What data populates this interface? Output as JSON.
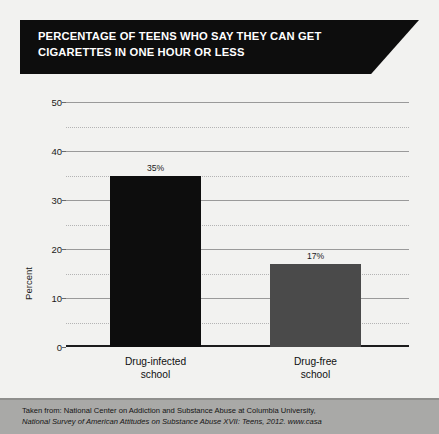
{
  "banner": {
    "line1": "PERCENTAGE OF TEENS WHO SAY THEY CAN GET",
    "line2": "CIGARETTES IN ONE HOUR OR LESS"
  },
  "footer": {
    "line1": "Taken from: National Center on Addiction and Substance Abuse at Columbia University,",
    "line2": "National Survey of American Attitudes on Substance Abuse XVII: Teens, 2012. www.casa"
  },
  "colors": {
    "bar_drug_infected": "#0d0d0d",
    "bar_drug_free": "#4a4a4a",
    "banner_background": "#0d0d0d",
    "page_background": "#f2f2f0",
    "footer_background": "#a9a9a7"
  },
  "chart_data": {
    "type": "bar",
    "title": "PERCENTAGE OF TEENS WHO SAY THEY CAN GET CIGARETTES IN ONE HOUR OR LESS",
    "xlabel": "",
    "ylabel": "Percent",
    "categories": [
      "Drug-infected school",
      "Drug-free school"
    ],
    "category_lines": [
      [
        "Drug-infected",
        "school"
      ],
      [
        "Drug-free",
        "school"
      ]
    ],
    "values": [
      35,
      17
    ],
    "data_labels": [
      "35%",
      "17%"
    ],
    "bar_colors": [
      "#0d0d0d",
      "#4a4a4a"
    ],
    "ylim": [
      0,
      50
    ],
    "yticks": [
      0,
      10,
      20,
      30,
      40,
      50
    ],
    "ytick_labels": [
      "0",
      "10",
      "20",
      "30",
      "40",
      "50"
    ],
    "minor_ticks": [
      5,
      15,
      25,
      35,
      45
    ],
    "grid": true,
    "legend": "none"
  }
}
